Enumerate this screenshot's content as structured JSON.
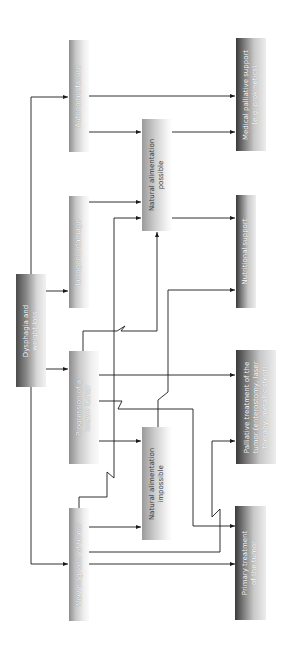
{
  "diagram": {
    "type": "flowchart",
    "orientation": "rotated-90-ccw",
    "nodes": {
      "dysphagia": {
        "line1": "Dysphagia and",
        "line2": "weight loss"
      },
      "autonomic": {
        "line1": "Autonomic failure"
      },
      "iatrogenic": {
        "line1": "Iatrogenic damage"
      },
      "progression": {
        "line1": "Progression of a",
        "line2": "known tumor"
      },
      "new_diagnosis": {
        "line1": "New diagnosis of tumor"
      },
      "nat_possible": {
        "line1": "Natural alimentation",
        "line2": "possible"
      },
      "nat_impossible": {
        "line1": "Natural alimentation",
        "line2": "impossible"
      },
      "medical_palliative": {
        "line1": "Medical palliative support",
        "line2": "(e.g. prokinetics)"
      },
      "nutritional": {
        "line1": "Nutritional support"
      },
      "palliative_treatment": {
        "line1": "Palliative treatment of the",
        "line2": "tumor (enterostomy, laser",
        "line3": "therapy, metallic stent)"
      },
      "primary_treatment": {
        "line1": "Primary treatment",
        "line2": "of the tumor"
      }
    },
    "edges": [
      {
        "from": "Dysphagia and weight loss",
        "to": "Autonomic failure"
      },
      {
        "from": "Dysphagia and weight loss",
        "to": "Iatrogenic damage"
      },
      {
        "from": "Dysphagia and weight loss",
        "to": "Progression of a known tumor"
      },
      {
        "from": "Dysphagia and weight loss",
        "to": "New diagnosis of tumor"
      },
      {
        "from": "Autonomic failure",
        "to": "Medical palliative support (e.g. prokinetics)"
      },
      {
        "from": "Autonomic failure",
        "to": "Natural alimentation possible"
      },
      {
        "from": "Iatrogenic damage",
        "to": "Natural alimentation possible"
      },
      {
        "from": "Progression of a known tumor",
        "to": "Natural alimentation possible"
      },
      {
        "from": "Progression of a known tumor",
        "to": "Natural alimentation impossible"
      },
      {
        "from": "Progression of a known tumor",
        "to": "Palliative treatment of the tumor"
      },
      {
        "from": "Progression of a known tumor",
        "to": "Primary treatment of the tumor"
      },
      {
        "from": "New diagnosis of tumor",
        "to": "Natural alimentation possible"
      },
      {
        "from": "New diagnosis of tumor",
        "to": "Natural alimentation impossible"
      },
      {
        "from": "New diagnosis of tumor",
        "to": "Palliative treatment of the tumor"
      },
      {
        "from": "New diagnosis of tumor",
        "to": "Primary treatment of the tumor"
      },
      {
        "from": "Natural alimentation possible",
        "to": "Medical palliative support (e.g. prokinetics)"
      },
      {
        "from": "Natural alimentation possible",
        "to": "Nutritional support"
      },
      {
        "from": "Natural alimentation impossible",
        "to": "Nutritional support"
      }
    ],
    "colors": {
      "line": "#1a1a1a",
      "background": "#ffffff"
    }
  }
}
